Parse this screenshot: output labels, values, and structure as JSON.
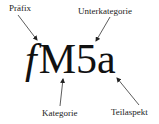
{
  "diagram": {
    "code": {
      "prefix": "f",
      "category": "M",
      "subcategory": "5",
      "subaspect": "a"
    },
    "labels": {
      "prefix": "Präfix",
      "subcategory": "Unterkategorie",
      "category": "Kategorie",
      "subaspect": "Teilaspekt"
    },
    "colors": {
      "text": "#111111",
      "arrow": "#333333",
      "background": "#ffffff"
    }
  }
}
